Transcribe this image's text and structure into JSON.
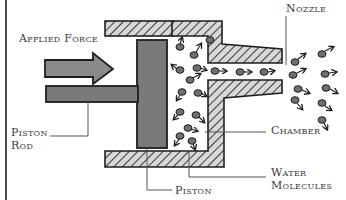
{
  "diagram": {
    "labels": {
      "applied_force": "Applied Force",
      "nozzle": "Nozzle",
      "piston_rod_line1": "Piston",
      "piston_rod_line2": "Rod",
      "chamber": "Chamber",
      "water_molecules_line1": "Water",
      "water_molecules_line2": "Molecules",
      "piston": "Piston"
    },
    "icons": [
      "force-arrow-icon",
      "water-molecule-icon"
    ],
    "colors": {
      "line": "#1e1e1e",
      "piston_fill": "#7a7a7a",
      "arrow_fill": "#8a8a8a",
      "hatch": "#3a3a3a",
      "label_text": "#3a3a3a",
      "leader_line": "#555555"
    }
  }
}
